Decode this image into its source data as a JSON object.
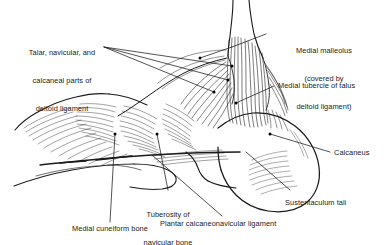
{
  "figure": {
    "line_color": "#1a1a1a",
    "background_color": "#ffffff",
    "leader_dot_color": "#000000"
  },
  "labels": {
    "deltoid_parts": {
      "name": "talar-navicular-calcaneal-parts-of-deltoid-ligament",
      "line1": "Talar, navicular, and",
      "line2": "calcaneal parts of",
      "line3": "deltoid ligament"
    },
    "medial_malleolus": {
      "name": "medial-malleolus",
      "line1": "Medial malleolus",
      "line2": "(covered by",
      "line3": "deltoid ligament)"
    },
    "medial_tubercle": {
      "name": "medial-tubercle-of-talus",
      "text": "Medial tubercle of talus"
    },
    "calcaneus": {
      "name": "calcaneus",
      "text": "Calcaneus"
    },
    "sustentaculum_tali": {
      "name": "sustentaculum-tali",
      "text": "Sustentaculum tali"
    },
    "plantar_calcaneonavicular": {
      "name": "plantar-calcaneonavicular-ligament",
      "text": "Plantar calcaneonavicular ligament"
    },
    "tuberosity_navicular": {
      "name": "tuberosity-of-navicular-bone",
      "line1": "Tuberosity of",
      "line2": "navicular bone"
    },
    "medial_cuneiform": {
      "name": "medial-cuneiform-bone",
      "text": "Medial cuneiform bone"
    }
  }
}
